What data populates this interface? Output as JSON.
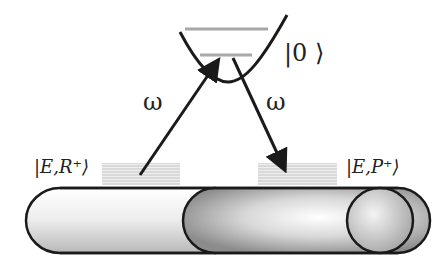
{
  "diagram": {
    "state_top": "|0 ⟩",
    "state_left": "|E,R⁺⟩",
    "state_right": "|E,P⁺⟩",
    "photon_left": "ω",
    "photon_right": "ω",
    "colors": {
      "stroke": "#1a1a1a",
      "level_line": "#aaaaaa",
      "band": "#d0d0d0",
      "tube_light": "#f2f2f2",
      "tube_dark": "#8a8a8a"
    }
  }
}
